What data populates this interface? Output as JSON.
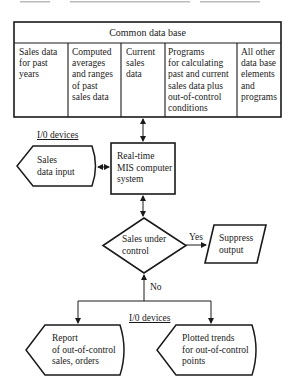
{
  "diagram": {
    "common_database": {
      "title": "Common data base",
      "columns": [
        {
          "text": "Sales data\nfor past\nyears"
        },
        {
          "text": "Computed\naverages\nand ranges\nof past\nsales data"
        },
        {
          "text": "Current\nsales\ndata"
        },
        {
          "text": "Programs\nfor calculating\npast and current\nsales data plus\nout-of-control\nconditions"
        },
        {
          "text": "All other\ndata base\nelements\nand\nprograms"
        }
      ]
    },
    "io_label_top": "I/0 devices",
    "input_display": "Sales\ndata input",
    "mis_system": "Real-time\nMIS computer\nsystem",
    "decision": "Sales under\ncontrol",
    "yes_label": "Yes",
    "no_label": "No",
    "suppress_output": "Suppress\noutput",
    "io_label_bottom": "I/0 devices",
    "report_display": "Report\nof out-of-control\nsales, orders",
    "trends_display": "Plotted trends\nfor out-of-control\npoints"
  }
}
